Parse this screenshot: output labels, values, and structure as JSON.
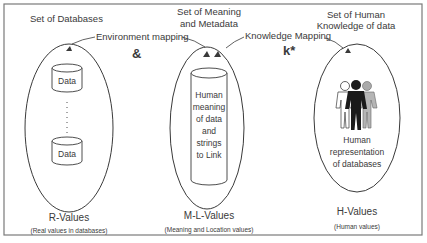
{
  "diagram": {
    "sets": [
      {
        "title": "Set of Databases",
        "label": "R-Values",
        "sublabel": "(Real values in databases)",
        "contents": [
          "Data",
          "Data"
        ]
      },
      {
        "title_line1": "Set of Meaning",
        "title_line2": "and Metadata",
        "label": "M-L-Values",
        "sublabel": "(Meaning and Location values)",
        "contents": [
          "Human",
          "meaning",
          "of data",
          "and",
          "strings",
          "to Link"
        ]
      },
      {
        "title_line1": "Set of Human",
        "title_line2": "Knowledge of data",
        "label": "H-Values",
        "sublabel": "(Human values)",
        "contents": [
          "Human",
          "representation",
          "of databases"
        ]
      }
    ],
    "mappings": {
      "environment": "Environment mapping",
      "knowledge": "Knowledge Mapping",
      "operator_and": "&",
      "operator_k": "k*"
    },
    "colors": {
      "line": "#3a3a3a",
      "frame": "#777777"
    },
    "icons": {
      "database": "database-cylinder-icon",
      "people": "people-group-icon"
    }
  }
}
